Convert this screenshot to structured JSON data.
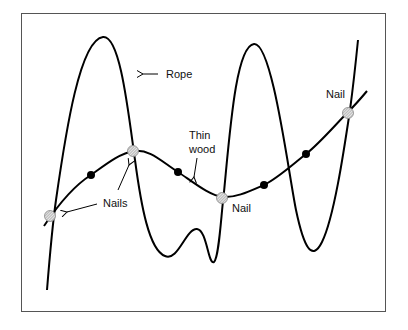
{
  "labels": {
    "rope": "Rope",
    "thin_wood_line1": "Thin",
    "thin_wood_line2": "wood",
    "nails": "Nails",
    "nail_middle": "Nail",
    "nail_right": "Nail"
  },
  "colors": {
    "frame": "#555555",
    "stroke": "#000000",
    "nail_fill": "#c8c8c8",
    "dot_fill": "#000000",
    "background": "#ffffff"
  },
  "elements": {
    "nails_count": 5,
    "dots_count": 4
  }
}
